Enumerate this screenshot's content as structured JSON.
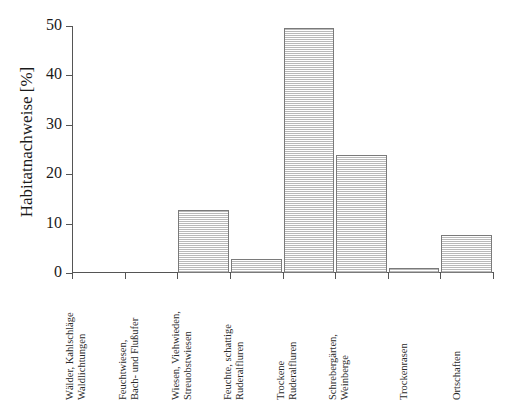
{
  "chart_data": {
    "type": "bar",
    "title": "",
    "xlabel": "",
    "ylabel": "Habitatnachweise [%]",
    "ylim": [
      0,
      50
    ],
    "yticks": [
      0,
      10,
      20,
      30,
      40,
      50
    ],
    "ytick_labels": [
      "0",
      "10",
      "20",
      "30",
      "40",
      "50"
    ],
    "grid": false,
    "legend": null,
    "categories": [
      "Wälder, Kahlschläge Waldlichtungen",
      "Feuchtwiesen, Bach- und Flußufer",
      "Wiesen, Viehwieden, Streuobstwiesen",
      "Feuchte, schattige Ruderalfluren",
      "Trockene Ruderalfluren",
      "Schrebergärten, Weinberge",
      "Trockenrasen",
      "Ortschaften"
    ],
    "category_lines": [
      [
        "Wälder, Kahlschläge",
        "Waldlichtungen"
      ],
      [
        "Feuchtwiesen,",
        "Bach- und Flußufer"
      ],
      [
        "Wiesen, Viehwieden,",
        "Streuobstwiesen"
      ],
      [
        "Feuchte, schattige",
        "Ruderalfluren"
      ],
      [
        "Trockene",
        "Ruderalfluren"
      ],
      [
        "Schrebergärten,",
        "Weinberge"
      ],
      [
        "Trockenrasen",
        ""
      ],
      [
        "Ortschaften",
        ""
      ]
    ],
    "values": [
      0,
      0,
      12.8,
      2.8,
      49.6,
      23.8,
      1.1,
      7.7
    ],
    "bar_fill": "#c4c4c4",
    "bar_edge": "#7a7a7a",
    "axis_color": "#555555",
    "text_color": "#1a1a1a"
  }
}
